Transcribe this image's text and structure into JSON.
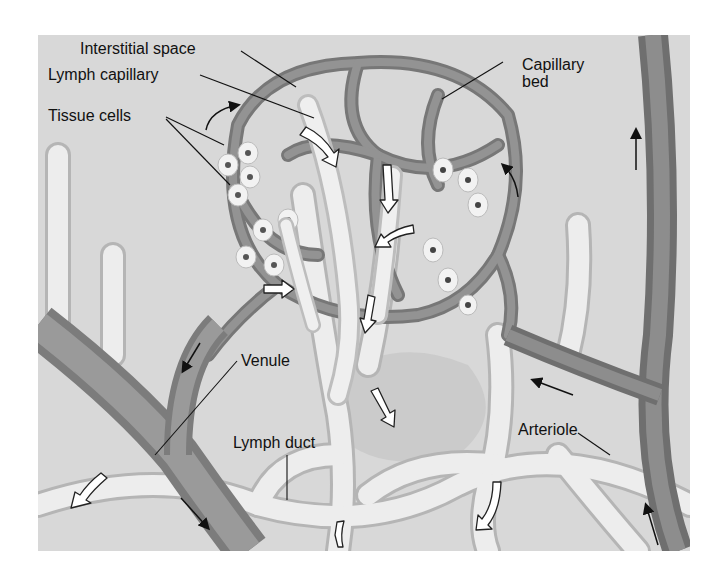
{
  "figure": {
    "background_color": "#d8d8d8",
    "colors": {
      "blood_vessel": "#8a8a8a",
      "blood_vessel_dark": "#6e6e6e",
      "lymph_vessel": "#ececec",
      "lymph_vessel_edge": "#b8b8b8",
      "tissue_fill": "#cfcfcf",
      "flow_arrow_fill": "#ffffff",
      "flow_arrow_stroke": "#222222"
    },
    "labels": {
      "interstitial_space": "Interstitial space",
      "lymph_capillary": "Lymph capillary",
      "tissue_cells": "Tissue cells",
      "capillary_bed": "Capillary bed",
      "capillary_bed_line1": "Capillary",
      "capillary_bed_line2": "bed",
      "venule": "Venule",
      "lymph_duct": "Lymph duct",
      "arteriole": "Arteriole"
    },
    "arrows": {
      "blood_flow": "small black arrows: blood enters from arteriole (upward), through capillary bed, exits via venule (downward-right)",
      "lymph_flow": "large white curved arrows: fluid drains into lymph capillaries and flows down lymph ducts"
    }
  }
}
